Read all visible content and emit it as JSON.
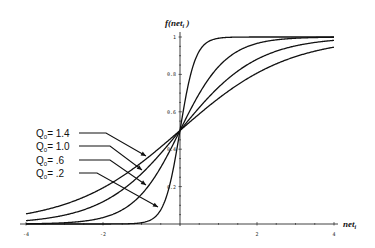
{
  "chart_data": {
    "type": "line",
    "title": "",
    "xlabel": "net_i",
    "ylabel": "f(net_i)",
    "xlim": [
      -4,
      4
    ],
    "ylim": [
      0,
      1
    ],
    "x_ticks": [
      -4,
      -2,
      2,
      4
    ],
    "x_tick_labels": [
      "-4",
      "-2",
      "2",
      "4"
    ],
    "y_ticks": [
      0.2,
      0.4,
      0.6,
      0.8,
      1
    ],
    "y_tick_labels": [
      "0.2",
      "0.4",
      "0.6",
      "0.8",
      "1"
    ],
    "grid": false,
    "legend_position": "left-annotations-with-arrows",
    "function": "f(net) = 1 / (1 + exp(-net / theta0))",
    "series": [
      {
        "name": "θ0 = 1.4",
        "label": "Q₀= 1.4",
        "theta0": 1.4,
        "x": [
          -4,
          -3,
          -2,
          -1,
          0,
          1,
          2,
          3,
          4
        ],
        "values": [
          0.054,
          0.105,
          0.193,
          0.329,
          0.5,
          0.671,
          0.807,
          0.895,
          0.946
        ]
      },
      {
        "name": "θ0 = 1.0",
        "label": "Q₀= 1.0",
        "theta0": 1.0,
        "x": [
          -4,
          -3,
          -2,
          -1,
          0,
          1,
          2,
          3,
          4
        ],
        "values": [
          0.018,
          0.047,
          0.119,
          0.269,
          0.5,
          0.731,
          0.881,
          0.953,
          0.982
        ]
      },
      {
        "name": "θ0 = .6",
        "label": "Q₀=   .6",
        "theta0": 0.6,
        "x": [
          -4,
          -3,
          -2,
          -1,
          0,
          1,
          2,
          3,
          4
        ],
        "values": [
          0.001,
          0.007,
          0.034,
          0.159,
          0.5,
          0.841,
          0.966,
          0.993,
          0.999
        ]
      },
      {
        "name": "θ0 = .2",
        "label": "Q₀=   .2",
        "theta0": 0.2,
        "x": [
          -4,
          -3,
          -2,
          -1,
          0,
          1,
          2,
          3,
          4
        ],
        "values": [
          0.0,
          0.0,
          0.0,
          0.007,
          0.5,
          0.993,
          1.0,
          1.0,
          1.0
        ]
      }
    ]
  },
  "axes": {
    "x_title": "net",
    "x_title_sub": "i",
    "y_title": "f(net",
    "y_title_sub": "i",
    "y_title_close": " )"
  },
  "legend": [
    {
      "prefix": "Q",
      "sub": "0",
      "text": "= 1.4"
    },
    {
      "prefix": "Q",
      "sub": "0",
      "text": "= 1.0"
    },
    {
      "prefix": "Q",
      "sub": "0",
      "text": "=   .6"
    },
    {
      "prefix": "Q",
      "sub": "0",
      "text": "=   .2"
    }
  ],
  "colors": {
    "line": "#111111",
    "background": "#ffffff"
  }
}
